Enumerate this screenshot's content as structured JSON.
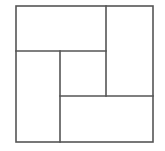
{
  "diagram": {
    "type": "square-partition",
    "stroke_color": "#555555",
    "background": "#ffffff",
    "outer_square": {
      "x": 16,
      "y": 6,
      "width": 137,
      "height": 136
    },
    "regions": [
      {
        "name": "top-left-rectangle",
        "x": 16,
        "y": 6,
        "width": 90,
        "height": 45
      },
      {
        "name": "right-rectangle",
        "x": 106,
        "y": 6,
        "width": 47,
        "height": 90
      },
      {
        "name": "bottom-right-rectangle",
        "x": 60,
        "y": 96,
        "width": 93,
        "height": 46
      },
      {
        "name": "left-rectangle",
        "x": 16,
        "y": 51,
        "width": 44,
        "height": 91
      },
      {
        "name": "center-square",
        "x": 60,
        "y": 51,
        "width": 46,
        "height": 45
      }
    ]
  }
}
